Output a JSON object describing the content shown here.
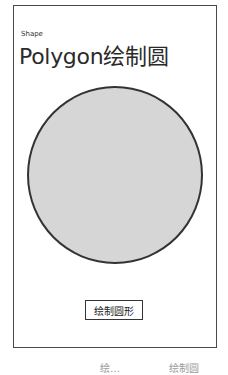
{
  "app": {
    "name": "Shape"
  },
  "page": {
    "title": "Polygon绘制圆"
  },
  "shape": {
    "type": "circle",
    "fill": "#d6d6d6",
    "stroke": "#333333"
  },
  "actions": {
    "draw_button_label": "绘制圆形"
  },
  "caption": {
    "left": "绘…",
    "right": "绘制圆"
  }
}
